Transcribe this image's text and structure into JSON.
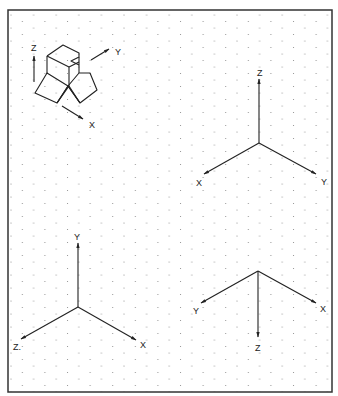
{
  "figure": {
    "frame": {
      "x": 8,
      "y": 10,
      "width": 324,
      "height": 382,
      "stroke": "#333333"
    },
    "grid": {
      "type": "isometric-dot",
      "column_spacing": 11.3,
      "row_spacing": 13,
      "dot_color": "#8a8a8a"
    },
    "object_view": {
      "description": "isometric block object with axis arrows",
      "axes": [
        {
          "label": "Z",
          "direction": "up"
        },
        {
          "label": "Y",
          "direction": "upper-right"
        },
        {
          "label": "X",
          "direction": "lower-right"
        }
      ]
    },
    "axis_sets": [
      {
        "name": "top-right",
        "origin": [
          259,
          143
        ],
        "labels": {
          "up": "Z",
          "lower_left": "X",
          "lower_right": "Y"
        }
      },
      {
        "name": "bottom-left",
        "origin": [
          78,
          307
        ],
        "labels": {
          "up": "Y",
          "lower_left": "Z",
          "lower_right": "X"
        }
      },
      {
        "name": "bottom-right",
        "origin": [
          258,
          271
        ],
        "labels": {
          "down": "Z",
          "upper_left": "Y",
          "upper_right": "X"
        }
      }
    ],
    "labels": {
      "obj_z": "Z",
      "obj_y": "Y",
      "obj_x": "X",
      "tr_z": "Z",
      "tr_x": "X",
      "tr_y": "Y",
      "bl_y": "Y",
      "bl_z": "Z.",
      "bl_x": "X",
      "br_y": "Y",
      "br_x": "X",
      "br_z": "Z"
    }
  }
}
